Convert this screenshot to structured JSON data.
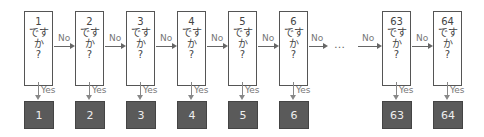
{
  "labels": {
    "no": "No",
    "yes": "Yes",
    "ellipsis": "…"
  },
  "nodes": [
    {
      "num": "1",
      "line1": "です",
      "line2": "か",
      "line3": "?",
      "answer": "1",
      "x": 24
    },
    {
      "num": "2",
      "line1": "です",
      "line2": "か",
      "line3": "?",
      "answer": "2",
      "x": 75
    },
    {
      "num": "3",
      "line1": "です",
      "line2": "か",
      "line3": "?",
      "answer": "3",
      "x": 126
    },
    {
      "num": "4",
      "line1": "です",
      "line2": "か",
      "line3": "?",
      "answer": "4",
      "x": 177
    },
    {
      "num": "5",
      "line1": "です",
      "line2": "か",
      "line3": "?",
      "answer": "5",
      "x": 228
    },
    {
      "num": "6",
      "line1": "です",
      "line2": "か",
      "line3": "?",
      "answer": "6",
      "x": 279
    },
    {
      "num": "63",
      "line1": "です",
      "line2": "か",
      "line3": "?",
      "answer": "63",
      "x": 382
    },
    {
      "num": "64",
      "line1": "です",
      "line2": "か",
      "line3": "?",
      "answer": "64",
      "x": 433
    }
  ],
  "colors": {
    "answer_fill": "#5a5a5a",
    "answer_text": "#eeeeee",
    "border": "#555555"
  }
}
